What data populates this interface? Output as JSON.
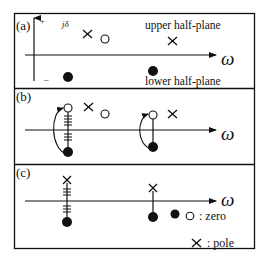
{
  "panels": {
    "a": {
      "label": "(a)",
      "axis_plus": "+",
      "axis_minus": "–",
      "j_delta": "jδ",
      "omega": "ω",
      "upper_label": "upper half-plane",
      "lower_label": "lower half-plane"
    },
    "b": {
      "label": "(b)",
      "omega": "ω"
    },
    "c": {
      "label": "(c)",
      "omega": "ω"
    }
  },
  "legend": {
    "zero_label": ": zero",
    "pole_label": ": pole"
  },
  "colors": {
    "ink": "#111111",
    "background": "#ffffff"
  }
}
